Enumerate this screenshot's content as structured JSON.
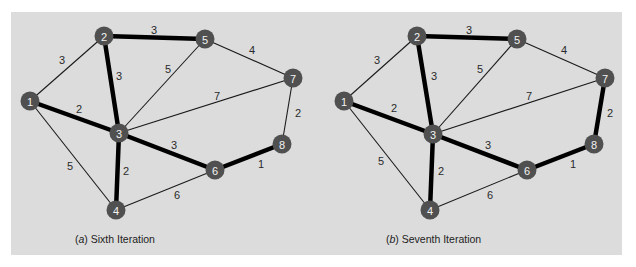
{
  "figure": {
    "panels": [
      {
        "id": "a",
        "caption_letter": "a",
        "caption_text": " Sixth Iteration",
        "nodes": [
          {
            "id": "1",
            "x": 30,
            "y": 101
          },
          {
            "id": "2",
            "x": 104,
            "y": 36
          },
          {
            "id": "3",
            "x": 119,
            "y": 133
          },
          {
            "id": "4",
            "x": 116,
            "y": 210
          },
          {
            "id": "5",
            "x": 205,
            "y": 39
          },
          {
            "id": "6",
            "x": 215,
            "y": 170
          },
          {
            "id": "7",
            "x": 293,
            "y": 78
          },
          {
            "id": "8",
            "x": 282,
            "y": 144
          }
        ],
        "edges": [
          {
            "from": "1",
            "to": "2",
            "weight": 3,
            "selected": false,
            "lx": 62,
            "ly": 60
          },
          {
            "from": "1",
            "to": "3",
            "weight": 2,
            "selected": true,
            "lx": 79,
            "ly": 109
          },
          {
            "from": "1",
            "to": "4",
            "weight": 5,
            "selected": false,
            "lx": 70,
            "ly": 166
          },
          {
            "from": "2",
            "to": "5",
            "weight": 3,
            "selected": true,
            "lx": 154,
            "ly": 30
          },
          {
            "from": "2",
            "to": "3",
            "weight": 3,
            "selected": true,
            "lx": 119,
            "ly": 76
          },
          {
            "from": "3",
            "to": "5",
            "weight": 5,
            "selected": false,
            "lx": 168,
            "ly": 69
          },
          {
            "from": "5",
            "to": "7",
            "weight": 4,
            "selected": false,
            "lx": 252,
            "ly": 50
          },
          {
            "from": "3",
            "to": "7",
            "weight": 7,
            "selected": false,
            "lx": 217,
            "ly": 96
          },
          {
            "from": "3",
            "to": "6",
            "weight": 3,
            "selected": true,
            "lx": 174,
            "ly": 145
          },
          {
            "from": "3",
            "to": "4",
            "weight": 2,
            "selected": true,
            "lx": 126,
            "ly": 171
          },
          {
            "from": "4",
            "to": "6",
            "weight": 6,
            "selected": false,
            "lx": 177,
            "ly": 195
          },
          {
            "from": "6",
            "to": "8",
            "weight": 1,
            "selected": true,
            "lx": 261,
            "ly": 164
          },
          {
            "from": "7",
            "to": "8",
            "weight": 2,
            "selected": false,
            "lx": 298,
            "ly": 113
          }
        ]
      },
      {
        "id": "b",
        "caption_letter": "b",
        "caption_text": " Seventh Iteration",
        "nodes": [
          {
            "id": "1",
            "x": 344,
            "y": 101
          },
          {
            "id": "2",
            "x": 417,
            "y": 36
          },
          {
            "id": "3",
            "x": 433,
            "y": 134
          },
          {
            "id": "4",
            "x": 430,
            "y": 210
          },
          {
            "id": "5",
            "x": 517,
            "y": 39
          },
          {
            "id": "6",
            "x": 527,
            "y": 170
          },
          {
            "id": "7",
            "x": 605,
            "y": 78
          },
          {
            "id": "8",
            "x": 594,
            "y": 144
          }
        ],
        "edges": [
          {
            "from": "1",
            "to": "2",
            "weight": 3,
            "selected": false,
            "lx": 377,
            "ly": 60
          },
          {
            "from": "1",
            "to": "3",
            "weight": 2,
            "selected": true,
            "lx": 394,
            "ly": 108
          },
          {
            "from": "1",
            "to": "4",
            "weight": 5,
            "selected": false,
            "lx": 381,
            "ly": 161
          },
          {
            "from": "2",
            "to": "5",
            "weight": 3,
            "selected": true,
            "lx": 469,
            "ly": 30
          },
          {
            "from": "2",
            "to": "3",
            "weight": 3,
            "selected": true,
            "lx": 434,
            "ly": 76
          },
          {
            "from": "3",
            "to": "5",
            "weight": 5,
            "selected": false,
            "lx": 480,
            "ly": 69
          },
          {
            "from": "5",
            "to": "7",
            "weight": 4,
            "selected": false,
            "lx": 564,
            "ly": 50
          },
          {
            "from": "3",
            "to": "7",
            "weight": 7,
            "selected": false,
            "lx": 529,
            "ly": 96
          },
          {
            "from": "3",
            "to": "6",
            "weight": 3,
            "selected": true,
            "lx": 488,
            "ly": 145
          },
          {
            "from": "3",
            "to": "4",
            "weight": 2,
            "selected": true,
            "lx": 441,
            "ly": 171
          },
          {
            "from": "4",
            "to": "6",
            "weight": 6,
            "selected": false,
            "lx": 490,
            "ly": 195
          },
          {
            "from": "6",
            "to": "8",
            "weight": 1,
            "selected": true,
            "lx": 573,
            "ly": 164
          },
          {
            "from": "7",
            "to": "8",
            "weight": 2,
            "selected": true,
            "lx": 610,
            "ly": 113
          }
        ]
      }
    ]
  },
  "captions": {
    "left_letter": "a",
    "left_text": " Sixth Iteration",
    "right_letter": "b",
    "right_text": " Seventh Iteration"
  },
  "colors": {
    "background": "#dcdcdc",
    "node_fill": "#505050",
    "node_label": "#f2f2f2",
    "edge": "#000000"
  }
}
